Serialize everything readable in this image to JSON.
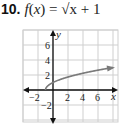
{
  "problem": {
    "number": "10.",
    "function_name": "f",
    "var": "x",
    "equation_rest": " = √x + 1"
  },
  "colors": {
    "grid": "#cfcfcf",
    "axis": "#111111",
    "curve": "#7a7a7a"
  },
  "chart_data": {
    "type": "line",
    "title": "f(x) = √x + 1",
    "xlabel": "x",
    "ylabel": "y",
    "xlim": [
      -4,
      8.4
    ],
    "ylim": [
      -4,
      8
    ],
    "grid": true,
    "grid_spacing": 2,
    "x_tick_labels": [
      "-2",
      "2",
      "4",
      "6"
    ],
    "y_tick_labels": [
      "6",
      "4",
      "2",
      "-2"
    ],
    "series": [
      {
        "name": "f(x) = √(x+1)",
        "x": [
          -1,
          -0.75,
          0,
          1,
          2,
          3,
          4,
          5,
          6,
          7,
          8
        ],
        "y": [
          0,
          0.5,
          1,
          1.41,
          1.73,
          2,
          2.24,
          2.45,
          2.65,
          2.83,
          3
        ],
        "arrow_end": true
      }
    ]
  }
}
